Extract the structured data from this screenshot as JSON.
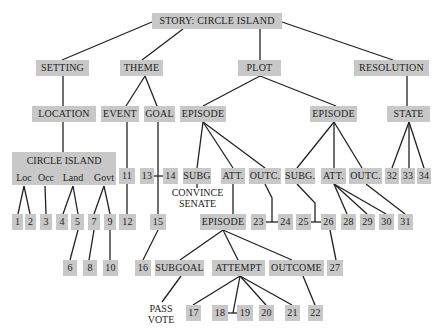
{
  "diagram": {
    "title": "STORY: CIRCLE ISLAND",
    "level1": {
      "setting": "SETTING",
      "theme": "THEME",
      "plot": "PLOT",
      "resolution": "RESOLUTION"
    },
    "level2": {
      "location": "LOCATION",
      "event": "EVENT",
      "goal": "GOAL",
      "episode_left": "EPISODE",
      "episode_right": "EPISODE",
      "state": "STATE"
    },
    "circle_island": {
      "title": "CIRCLE ISLAND",
      "attrs": [
        "Loc",
        "Occ",
        "Land",
        "Govt"
      ]
    },
    "episode_left_children": [
      "SUBG",
      "ATT.",
      "OUTC."
    ],
    "episode_right_children": [
      "SUBG.",
      "ATT.",
      "OUTC."
    ],
    "subg_annotation": [
      "CONVINCE",
      "SENATE"
    ],
    "nested_episode": "EPISODE",
    "nested_children": [
      "SUBGOAL",
      "ATTEMPT",
      "OUTCOME"
    ],
    "subgoal_annotation": [
      "PASS",
      "VOTE"
    ],
    "numbers": {
      "n1": "1",
      "n2": "2",
      "n3": "3",
      "n4": "4",
      "n5": "5",
      "n6": "6",
      "n7": "7",
      "n8": "8",
      "n9": "9",
      "n10": "10",
      "n11": "11",
      "n12": "12",
      "n13": "13",
      "n14": "14",
      "n15": "15",
      "n16": "16",
      "n17": "17",
      "n18": "18",
      "n19": "19",
      "n20": "20",
      "n21": "21",
      "n22": "22",
      "n23": "23",
      "n24": "24",
      "n25": "25",
      "n26": "26",
      "n27": "27",
      "n28": "28",
      "n29": "29",
      "n30": "30",
      "n31": "31",
      "n32": "32",
      "n33": "33",
      "n34": "34"
    },
    "colors": {
      "node_fill": "#c8c8c8",
      "line": "#222222",
      "text": "#222222"
    }
  }
}
